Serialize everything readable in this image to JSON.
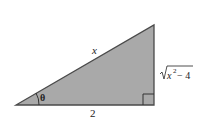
{
  "diagram": {
    "type": "right-triangle",
    "fill_color": "#a9a9a9",
    "stroke_color": "#4a4a4a",
    "labels": {
      "hypotenuse": "x",
      "adjacent": "2",
      "opposite_radicand": "x",
      "opposite_exponent": "2",
      "opposite_rest": " − 4",
      "angle": "θ"
    }
  }
}
